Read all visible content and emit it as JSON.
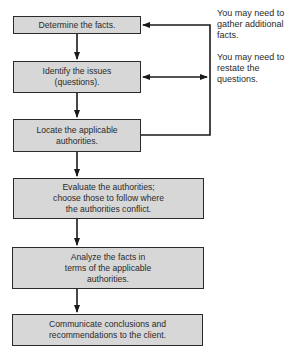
{
  "diagram": {
    "type": "flowchart",
    "colors": {
      "box_fill": "#d7d7d7",
      "box_border": "#2a2a2a",
      "text": "#2a2a2a",
      "background": "#ffffff"
    },
    "steps": [
      {
        "id": "determine-facts",
        "label": "Determine the facts."
      },
      {
        "id": "identify-issues",
        "label": "Identify the issues\n(questions)."
      },
      {
        "id": "locate-authorities",
        "label": "Locate the applicable\nauthorities."
      },
      {
        "id": "evaluate-authorities",
        "label": "Evaluate the authorities;\nchoose those to follow where\nthe authorities conflict."
      },
      {
        "id": "analyze-facts",
        "label": "Analyze the facts in\nterms of the applicable\nauthorities."
      },
      {
        "id": "communicate-conclusions",
        "label": "Communicate conclusions and\nrecommendations to the client."
      }
    ],
    "annotations": [
      {
        "id": "gather-facts-note",
        "text": "You may need to\ngather additional\nfacts."
      },
      {
        "id": "restate-questions-note",
        "text": "You may need to\nrestate the\nquestions."
      }
    ],
    "connections": [
      {
        "from": "determine-facts",
        "to": "identify-issues",
        "kind": "arrow-down"
      },
      {
        "from": "identify-issues",
        "to": "locate-authorities",
        "kind": "arrow-down"
      },
      {
        "from": "locate-authorities",
        "to": "evaluate-authorities",
        "kind": "arrow-down"
      },
      {
        "from": "evaluate-authorities",
        "to": "analyze-facts",
        "kind": "arrow-down"
      },
      {
        "from": "analyze-facts",
        "to": "communicate-conclusions",
        "kind": "arrow-down"
      },
      {
        "from": "locate-authorities",
        "to": "determine-facts",
        "kind": "feedback-loop"
      },
      {
        "from": "identify-issues",
        "to": "feedback-loop",
        "kind": "double-arrow"
      }
    ]
  }
}
